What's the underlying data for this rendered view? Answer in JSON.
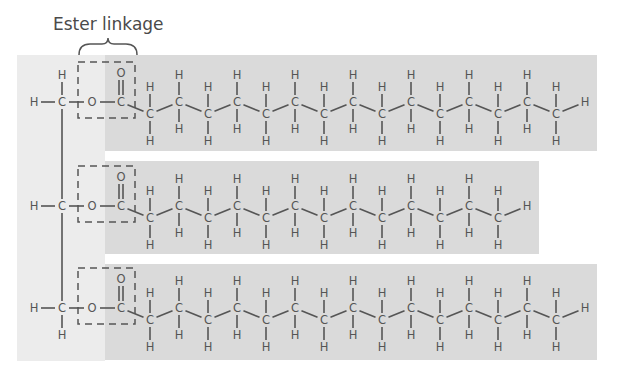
{
  "diagram": {
    "label": "Ester linkage",
    "colors": {
      "background": "#ffffff",
      "glycerol_panel": "#ececec",
      "chain_band": "#dadada",
      "stroke": "#555555",
      "text": "#555555"
    },
    "atoms": {
      "carbon": "C",
      "hydrogen": "H",
      "oxygen": "O"
    },
    "glycerol": {
      "panel": {
        "x": 17,
        "y": 55,
        "w": 88,
        "h": 306
      },
      "carbons": [
        {
          "row_y": 102,
          "h_left": true,
          "h_top": true,
          "h_bottom": false
        },
        {
          "row_y": 206,
          "h_left": true,
          "h_top": false,
          "h_bottom": false
        },
        {
          "row_y": 308,
          "h_left": true,
          "h_top": false,
          "h_bottom": true
        }
      ]
    },
    "fatty_acids": [
      {
        "name": "fatty-acid-1",
        "band": {
          "x": 105,
          "y": 55,
          "w": 492,
          "h": 96
        },
        "row_y": 102,
        "ch_carbons": 15,
        "total_carbons": 16
      },
      {
        "name": "fatty-acid-2",
        "band": {
          "x": 105,
          "y": 161,
          "w": 434,
          "h": 93
        },
        "row_y": 206,
        "ch_carbons": 13,
        "total_carbons": 14
      },
      {
        "name": "fatty-acid-3",
        "band": {
          "x": 105,
          "y": 264,
          "w": 492,
          "h": 96
        },
        "row_y": 308,
        "ch_carbons": 15,
        "total_carbons": 16
      }
    ]
  }
}
